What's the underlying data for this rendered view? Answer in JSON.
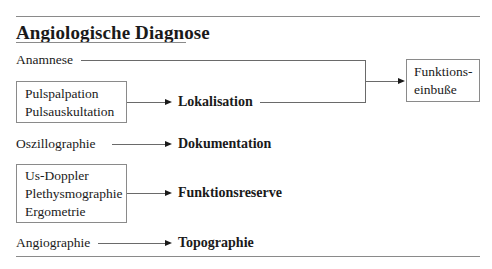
{
  "title": "Angiologische Diagnose",
  "methods": {
    "anamnese": "Anamnese",
    "box1": [
      "Pulspalpation",
      "Pulsauskultation"
    ],
    "oszillo": "Oszillographie",
    "box2": [
      "Us-Doppler",
      "Plethysmographie",
      "Ergometrie"
    ],
    "angio": "Angiographie"
  },
  "results": {
    "lokalisation": "Lokalisation",
    "dokumentation": "Dokumentation",
    "funktionsreserve": "Funktionsreserve",
    "topographie": "Topographie"
  },
  "outcome": {
    "line1": "Funktions-",
    "line2": "einbuße"
  }
}
